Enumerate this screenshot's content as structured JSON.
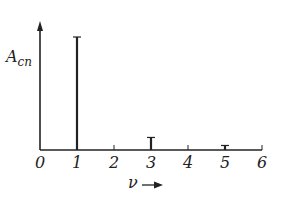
{
  "chart_data": {
    "type": "bar",
    "title": "",
    "ylabel": "A_cn",
    "ylabel_main": "A",
    "ylabel_sub": "cn",
    "xlabel": "ν",
    "xlabel_arrow": "→",
    "x_ticks": [
      0,
      1,
      2,
      3,
      4,
      5,
      6
    ],
    "x_tick_labels": [
      "0",
      "1",
      "2",
      "3",
      "4",
      "5",
      "6"
    ],
    "xlim": [
      0,
      6
    ],
    "ylim": [
      0,
      1.1
    ],
    "grid": false,
    "legend": null,
    "categories": [
      1,
      3,
      5
    ],
    "values": [
      1.0,
      0.111,
      0.04
    ],
    "style": "line spectrum (stem lines with caps)"
  },
  "colors": {
    "ink": "#222222",
    "background": "#ffffff"
  }
}
